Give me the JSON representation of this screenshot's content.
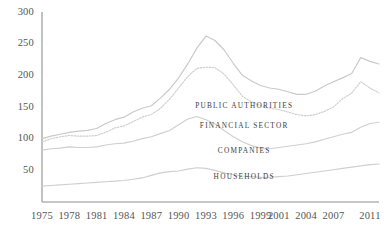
{
  "chart_data": {
    "type": "line",
    "title": "",
    "subtitle": "",
    "xlabel": "",
    "ylabel": "",
    "xlim": [
      1975,
      2012
    ],
    "ylim": [
      0,
      300
    ],
    "grid": false,
    "legend_position": "inline-right",
    "y_ticks": [
      300,
      250,
      200,
      150,
      100,
      50
    ],
    "x_ticks": [
      1975,
      1978,
      1981,
      1984,
      1987,
      1990,
      1993,
      1996,
      1999,
      2001,
      2004,
      2007,
      2011
    ],
    "x_tick_labels": [
      "1975",
      "1978",
      "1981",
      "1984",
      "1987",
      "1990",
      "1993",
      "1996",
      "1999",
      "2001",
      "2004",
      "2007",
      "2011"
    ],
    "y_tick_labels": [
      "300",
      "250",
      "200",
      "150",
      "100",
      "50"
    ],
    "x": [
      1975,
      1976,
      1977,
      1978,
      1979,
      1980,
      1981,
      1982,
      1983,
      1984,
      1985,
      1986,
      1987,
      1988,
      1989,
      1990,
      1991,
      1992,
      1993,
      1994,
      1995,
      1996,
      1997,
      1998,
      1999,
      2000,
      2001,
      2002,
      2003,
      2004,
      2005,
      2006,
      2007,
      2008,
      2009,
      2010,
      2011,
      2012
    ],
    "series": [
      {
        "name": "PUBLIC AUTHORITIES",
        "style": "solid",
        "color": "#c9c9c9",
        "label_x": 1997.2,
        "label_y": 152,
        "values": [
          100,
          104,
          107,
          110,
          112,
          113,
          116,
          124,
          130,
          134,
          142,
          148,
          152,
          164,
          178,
          196,
          218,
          243,
          262,
          255,
          240,
          219,
          200,
          191,
          184,
          180,
          178,
          174,
          170,
          170,
          175,
          183,
          190,
          196,
          203,
          228,
          222,
          218
        ]
      },
      {
        "name": "FINANCIAL SECTOR",
        "style": "dotted",
        "color": "#cfcfcf",
        "label_x": 1997.2,
        "label_y": 120,
        "values": [
          95,
          100,
          103,
          105,
          104,
          104,
          105,
          110,
          117,
          120,
          127,
          134,
          138,
          148,
          162,
          180,
          198,
          211,
          213,
          212,
          202,
          185,
          167,
          158,
          152,
          148,
          146,
          142,
          138,
          136,
          138,
          143,
          150,
          163,
          172,
          190,
          180,
          172
        ]
      },
      {
        "name": "COMPANIES",
        "style": "solid",
        "color": "#cfcfcf",
        "label_x": 1997.2,
        "label_y": 80,
        "values": [
          82,
          84,
          85,
          87,
          86,
          86,
          87,
          90,
          92,
          93,
          96,
          100,
          103,
          108,
          113,
          122,
          131,
          135,
          130,
          123,
          113,
          103,
          95,
          89,
          85,
          84,
          86,
          88,
          90,
          92,
          95,
          99,
          103,
          107,
          110,
          118,
          124,
          126
        ]
      },
      {
        "name": "HOUSEHOLDS",
        "style": "solid",
        "color": "#cfcfcf",
        "label_x": 1997.2,
        "label_y": 40,
        "values": [
          25,
          26,
          27,
          28,
          29,
          30,
          31,
          32,
          33,
          34,
          36,
          38,
          42,
          46,
          48,
          49,
          52,
          54,
          53,
          50,
          46,
          43,
          41,
          40,
          39,
          39,
          40,
          41,
          43,
          45,
          47,
          49,
          51,
          53,
          55,
          57,
          59,
          60
        ]
      }
    ],
    "axis_color": "#8f8f8f"
  }
}
